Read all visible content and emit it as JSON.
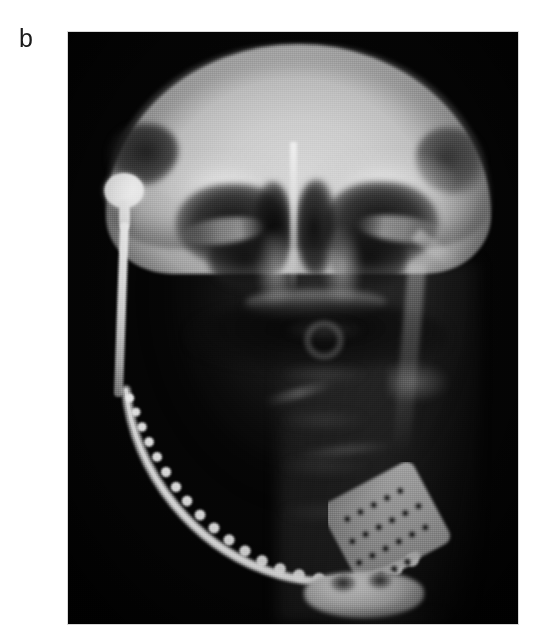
{
  "figure": {
    "panel_label": "b",
    "modality": "radiograph",
    "view": "posteroanterior skull / mandible",
    "background_color": "#ffffff",
    "plate_color": "#050505",
    "bone_highlight_color": "#d9d9d9",
    "implant_color": "#ffffff"
  },
  "plate": {
    "x": 68,
    "y": 32,
    "width": 450,
    "height": 592
  },
  "anatomy": {
    "calvarium": "cranial-vault",
    "orbit_left": "orbit-left",
    "orbit_right": "orbit-right",
    "nasal_septum": "nasal-septum",
    "maxillary_sinus_left": "maxillary-sinus-left",
    "maxillary_sinus_right": "maxillary-sinus-right",
    "cervical_spine": "cervical-spine",
    "hard_palate": "hard-palate",
    "symphysis": "mandibular-symphysis"
  },
  "implants": {
    "condylar_head": "condylar-prosthesis-head",
    "ramus_shaft": "prosthesis-ramus-shaft",
    "mandibular_arc": "mandibular-reconstruction-plate",
    "perforated_plate": "perforated-bone-plate"
  },
  "plate_beads": [
    {
      "cx": 22,
      "cy": 66,
      "r": 4.4
    },
    {
      "cx": 28,
      "cy": 80,
      "r": 4.6
    },
    {
      "cx": 34,
      "cy": 95,
      "r": 4.8
    },
    {
      "cx": 41,
      "cy": 110,
      "r": 5.0
    },
    {
      "cx": 49,
      "cy": 125,
      "r": 5.1
    },
    {
      "cx": 58,
      "cy": 140,
      "r": 5.2
    },
    {
      "cx": 68,
      "cy": 155,
      "r": 5.3
    },
    {
      "cx": 79,
      "cy": 169,
      "r": 5.4
    },
    {
      "cx": 92,
      "cy": 183,
      "r": 5.5
    },
    {
      "cx": 106,
      "cy": 196,
      "r": 5.6
    },
    {
      "cx": 121,
      "cy": 208,
      "r": 5.7
    },
    {
      "cx": 137,
      "cy": 219,
      "r": 5.8
    },
    {
      "cx": 154,
      "cy": 229,
      "r": 5.9
    },
    {
      "cx": 172,
      "cy": 237,
      "r": 6.0
    },
    {
      "cx": 191,
      "cy": 243,
      "r": 6.1
    },
    {
      "cx": 211,
      "cy": 247,
      "r": 6.2
    },
    {
      "cx": 231,
      "cy": 249,
      "r": 6.3
    },
    {
      "cx": 251,
      "cy": 248,
      "r": 6.4
    },
    {
      "cx": 270,
      "cy": 244,
      "r": 6.5
    },
    {
      "cx": 288,
      "cy": 237,
      "r": 6.6
    },
    {
      "cx": 304,
      "cy": 228,
      "r": 6.8
    }
  ],
  "perforation_rows": [
    {
      "y": 22,
      "xs": [
        16,
        31,
        46,
        61,
        76
      ],
      "r": 3.4,
      "angle": -28
    },
    {
      "y": 44,
      "xs": [
        10,
        25,
        40,
        55,
        70,
        85
      ],
      "r": 3.5,
      "angle": -28
    },
    {
      "y": 66,
      "xs": [
        6,
        21,
        36,
        51,
        66,
        81
      ],
      "r": 3.5,
      "angle": -28
    },
    {
      "y": 88,
      "xs": [
        4,
        19,
        34,
        49
      ],
      "r": 3.4,
      "angle": -28
    }
  ]
}
